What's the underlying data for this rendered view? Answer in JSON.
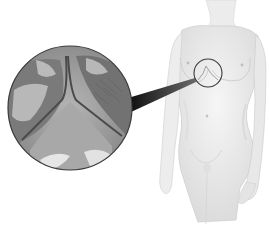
{
  "figure": {
    "type": "medical-illustration",
    "colors": {
      "background": "#ffffff",
      "body_fill": "#eeeeee",
      "body_shadow": "#d2d2d2",
      "inset_outline": "#3a3a3a",
      "pointer": "#1a1a1a",
      "skin_dark": "#6e6e6e",
      "skin_mid": "#9a9a9a",
      "skin_light": "#d8d8d8"
    },
    "inset": {
      "label": "magnified-view",
      "center": [
        70,
        108
      ],
      "radius": 62
    },
    "focus_ring": {
      "center": [
        208,
        73
      ],
      "radius": 14
    }
  }
}
